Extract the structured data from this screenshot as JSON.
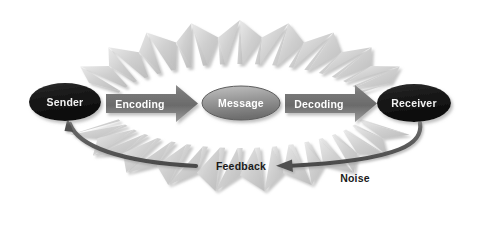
{
  "diagram": {
    "type": "process-flow",
    "background_color": "#ffffff",
    "nodes": [
      {
        "id": "sender",
        "label": "Sender",
        "shape": "ellipse",
        "cx": 65,
        "cy": 102,
        "rx": 36,
        "ry": 19,
        "fill": "#171717",
        "fill_light": "#3d3d3d",
        "text_color": "#f2f2f2"
      },
      {
        "id": "message",
        "label": "Message",
        "shape": "ellipse",
        "cx": 241,
        "cy": 103,
        "rx": 39,
        "ry": 17,
        "fill": "#8c8c8c",
        "fill_light": "#c9c9c9",
        "text_color": "#ffffff"
      },
      {
        "id": "receiver",
        "label": "Receiver",
        "shape": "ellipse",
        "cx": 414,
        "cy": 103,
        "rx": 37,
        "ry": 19,
        "fill": "#171717",
        "fill_light": "#3d3d3d",
        "text_color": "#f2f2f2"
      }
    ],
    "arrows": [
      {
        "id": "encoding",
        "label": "Encoding",
        "direction": "right",
        "x": 106,
        "y": 89,
        "width": 92,
        "height": 29,
        "fill_dark": "#6f6f6f",
        "fill_light": "#a8a8a8",
        "text_color": "#ffffff"
      },
      {
        "id": "decoding",
        "label": "Decoding",
        "direction": "right",
        "x": 285,
        "y": 89,
        "width": 92,
        "height": 29,
        "fill_dark": "#6f6f6f",
        "fill_light": "#a8a8a8",
        "text_color": "#ffffff"
      }
    ],
    "feedback": {
      "label": "Feedback",
      "label_x": 241,
      "label_y": 163,
      "color": "#595959",
      "description": "curved arrow from Receiver back to Sender, interrupted by the Feedback label with arrowheads pointing inward from both sides"
    },
    "noise": {
      "label": "Noise",
      "label_x": 355,
      "label_y": 178,
      "color": "#c4c4c4",
      "shadow_color": "#d9d9d9",
      "description": "light gray zigzag spike ring radiating outward around the whole process"
    }
  }
}
